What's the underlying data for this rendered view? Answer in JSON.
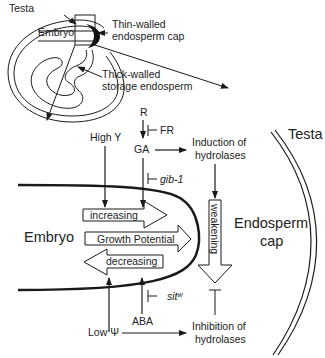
{
  "inset": {
    "testa": "Testa",
    "embryo": "Embryo",
    "thin_walled_line1": "Thin-walled",
    "thin_walled_line2": "endosperm cap",
    "thick_walled_line1": "Thick-walled",
    "thick_walled_line2": "storage endosperm"
  },
  "signals": {
    "r": "R",
    "fr": "FR",
    "ga": "GA",
    "gib1": "gib-1",
    "high_psi": "High Y",
    "induction_line1": "Induction of",
    "induction_line2": "hydrolases",
    "low_psi": "Low Ψ",
    "aba": "ABA",
    "sitw": "sit",
    "sitw_sup": "w",
    "inhibition_line1": "Inhibition of",
    "inhibition_line2": "hydrolases"
  },
  "main": {
    "testa": "Testa",
    "embryo": "Embryo",
    "endosperm_line1": "Endosperm",
    "endosperm_line2": "cap",
    "increasing": "increasing",
    "growth_potential": "Growth Potential",
    "decreasing": "decreasing",
    "weakening": "weakening"
  },
  "colors": {
    "stroke": "#1a1a1a",
    "text": "#222222",
    "background": "#ffffff"
  }
}
